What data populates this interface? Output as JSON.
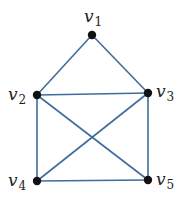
{
  "diagram": {
    "type": "graph",
    "edge_color": "#3f6c9c",
    "node_color": "#111111",
    "nodes": [
      {
        "id": "v1",
        "base": "v",
        "sub": "1",
        "x": 92,
        "y": 35,
        "lx": 84,
        "ly": 22
      },
      {
        "id": "v2",
        "base": "v",
        "sub": "2",
        "x": 37,
        "y": 95,
        "lx": 8,
        "ly": 100
      },
      {
        "id": "v3",
        "base": "v",
        "sub": "3",
        "x": 148,
        "y": 93,
        "lx": 156,
        "ly": 97
      },
      {
        "id": "v4",
        "base": "v",
        "sub": "4",
        "x": 37,
        "y": 181,
        "lx": 8,
        "ly": 186
      },
      {
        "id": "v5",
        "base": "v",
        "sub": "5",
        "x": 148,
        "y": 180,
        "lx": 156,
        "ly": 185
      }
    ],
    "edges": [
      [
        "v1",
        "v2"
      ],
      [
        "v1",
        "v3"
      ],
      [
        "v2",
        "v3"
      ],
      [
        "v2",
        "v4"
      ],
      [
        "v3",
        "v5"
      ],
      [
        "v4",
        "v5"
      ],
      [
        "v2",
        "v5"
      ],
      [
        "v3",
        "v4"
      ]
    ]
  }
}
